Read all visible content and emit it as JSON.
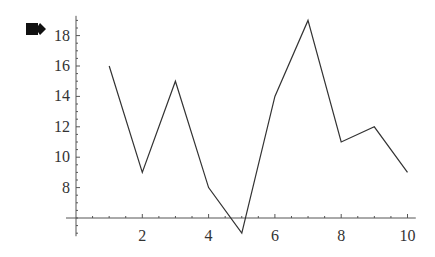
{
  "icon": "cell-bracket-icon",
  "chart_data": {
    "type": "line",
    "title": "",
    "xlabel": "",
    "ylabel": "",
    "x": [
      1,
      2,
      3,
      4,
      5,
      6,
      7,
      8,
      9,
      10
    ],
    "values": [
      16,
      9,
      15,
      8,
      5,
      14,
      19,
      11,
      12,
      9
    ],
    "xlim": [
      0,
      10.2
    ],
    "ylim": [
      5,
      19
    ],
    "axis_origin": {
      "x": 0,
      "y": 6
    },
    "x_ticks": [
      2,
      4,
      6,
      8,
      10
    ],
    "y_ticks": [
      8,
      10,
      12,
      14,
      16,
      18
    ],
    "grid": false,
    "legend": false,
    "line_color": "#333333"
  }
}
